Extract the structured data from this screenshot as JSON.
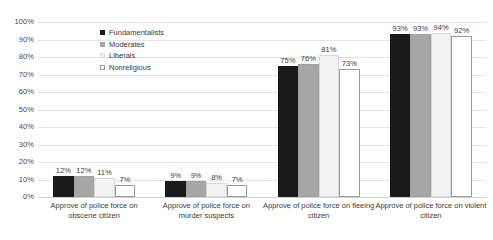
{
  "chart_data": {
    "type": "bar",
    "title": "",
    "xlabel": "",
    "ylabel": "",
    "ylim": [
      0,
      100
    ],
    "grid": true,
    "legend_position": "top-left-inside",
    "categories": [
      "Approve of police force on obscene citizen",
      "Approve of police force on murder suspects",
      "Approve of police force on fleeing citizen",
      "Approve of police force on violent citizen"
    ],
    "ticks": [
      "0%",
      "10%",
      "20%",
      "30%",
      "40%",
      "50%",
      "60%",
      "70%",
      "80%",
      "90%",
      "100%"
    ],
    "series": [
      {
        "name": "Fundamentalists",
        "color": "#1a1a1a",
        "values": [
          12,
          9,
          75,
          93
        ],
        "labels": [
          "12%",
          "9%",
          "75%",
          "93%"
        ]
      },
      {
        "name": "Moderates",
        "color": "#a6a6a6",
        "values": [
          12,
          9,
          76,
          93
        ],
        "labels": [
          "12%",
          "9%",
          "76%",
          "93%"
        ]
      },
      {
        "name": "Liberals",
        "color": "#f2f2f2",
        "values": [
          11,
          8,
          81,
          94
        ],
        "labels": [
          "11%",
          "8%",
          "81%",
          "94%"
        ]
      },
      {
        "name": "Nonreligious",
        "color": "#ffffff",
        "values": [
          7,
          7,
          73,
          92
        ],
        "labels": [
          "7%",
          "7%",
          "73%",
          "92%"
        ]
      }
    ]
  }
}
